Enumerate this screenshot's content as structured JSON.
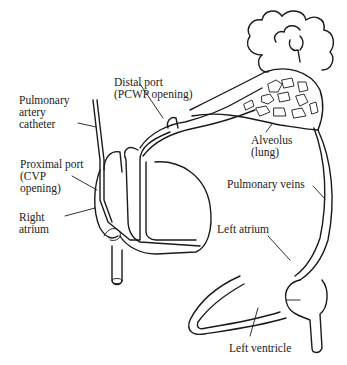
{
  "diagram": {
    "labels": {
      "pa_catheter": "Pulmonary\nartery\ncatheter",
      "proximal_port": "Proximal port\n(CVP\nopening)",
      "right_atrium": "Right\natrium",
      "distal_port": "Distal port\n(PCWP opening)",
      "alveolus": "Alveolus\n(lung)",
      "pulmonary_veins": "Pulmonary veins",
      "left_atrium": "Left atrium",
      "left_ventricle": "Left ventricle"
    },
    "colors": {
      "line": "#1a1a1a",
      "text": "#222222",
      "background": "#ffffff"
    }
  }
}
